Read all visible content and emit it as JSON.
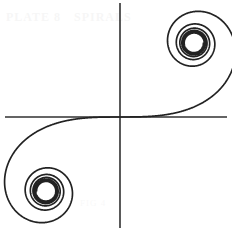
{
  "figure": {
    "width": 232,
    "height": 230,
    "background_color": "#ffffff"
  },
  "ghost": {
    "top_left": "PLATE 8",
    "top_right": "SPIRALS",
    "bottom": "FIG 4"
  },
  "chart_data": {
    "type": "line",
    "subtitle": "Euler spiral / clothoid — parametric plot of the Fresnel integrals",
    "xlabel": "",
    "ylabel": "",
    "grid": false,
    "legend": false,
    "axes_visible": true,
    "origin_px": [
      120,
      117
    ],
    "x_axis_px": {
      "x_start": 5,
      "x_end": 227,
      "y": 117
    },
    "y_axis_px": {
      "y_start": 3,
      "y_end": 228,
      "x": 120
    },
    "axis_color": "#303030",
    "axis_width_px": 1.6,
    "curve_color": "#222222",
    "curve_width_px": 1.7,
    "parametric": {
      "x_expr": "C(t) = integral_0^t cos(pi*u^2/2) du",
      "y_expr": "S(t) = integral_0^t sin(pi*u^2/2) du",
      "t_min": -5.0,
      "t_max": 5.0,
      "samples": 2600
    },
    "scale_px_per_unit": 148,
    "y_axis_points_up": true,
    "asymptotic_centers": [
      {
        "name": "upper-right-spiral-center",
        "xy": [
          0.5,
          0.5
        ],
        "px": [
          188,
          47
        ],
        "turns": 2.1
      },
      {
        "name": "lower-left-spiral-center",
        "xy": [
          -0.5,
          -0.5
        ],
        "px": [
          45,
          183
        ],
        "turns": 2.1
      }
    ],
    "xlim": [
      -0.78,
      0.72
    ],
    "ylim": [
      -0.75,
      0.77
    ]
  }
}
